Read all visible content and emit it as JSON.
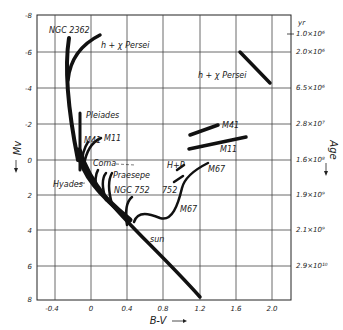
{
  "figure": {
    "x_axis_label": "B-V",
    "y_axis_left_label": "Mv",
    "y_axis_right_label": "Age",
    "y_axis_right_unit": "yr",
    "x_ticks": [
      "-0.4",
      "0",
      "0.4",
      "0.8",
      "1.2",
      "1.6",
      "2.0"
    ],
    "y_ticks": [
      "-8",
      "-6",
      "-4",
      "-2",
      "0",
      "2",
      "4",
      "6",
      "8"
    ],
    "age_ticks": [
      "1.0×10⁶",
      "2.0×10⁶",
      "6.5×10⁶",
      "2.8×10⁷",
      "1.6×10⁸",
      "1.9×10⁹",
      "2.1×10⁹",
      "2.9×10¹⁰"
    ],
    "cluster_labels": {
      "ngc2362": "NGC 2362",
      "h_chi_persei": "h + χ Persei",
      "h_chi_persei_age": "h + χ Persei",
      "pleiades": "Pleiades",
      "m41": "M41",
      "m11": "M11",
      "m41_age": "M41",
      "m11_age": "M11",
      "coma": "Coma",
      "hyades": "Hyades",
      "praesepe": "Praesepe",
      "ngc752": "NGC 752",
      "hp": "H+P",
      "n752_short": "752",
      "m67_upper": "M67",
      "m67_lower": "M67",
      "sun": "sun"
    }
  }
}
